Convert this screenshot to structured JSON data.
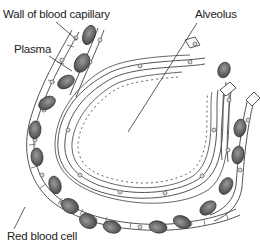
{
  "diagram": {
    "labels": {
      "wall": "Wall of blood capillary",
      "plasma": "Plasma",
      "alveolus": "Alveolus",
      "red_blood_cell": "Red blood cell"
    },
    "colors": {
      "line": "#444444",
      "cell_fill": "#e4e4e4",
      "rbc_fill": "#6b6b6b",
      "rbc_highlight": "#9a9a9a",
      "text": "#222222"
    }
  }
}
